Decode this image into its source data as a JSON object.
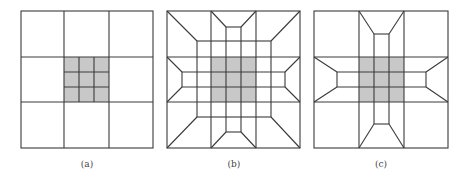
{
  "figure": {
    "colors": {
      "line": "#3a3a3a",
      "shade": "#c8c8c8",
      "background": "#ffffff"
    },
    "panels": [
      {
        "id": "a",
        "label": "(a)",
        "description": "3x3 grid with shaded center cell subdivided 3x3"
      },
      {
        "id": "b",
        "label": "(b)",
        "description": "Shaded center 3x3 block with transition elements extending to boundary in all directions including corners"
      },
      {
        "id": "c",
        "label": "(c)",
        "description": "Shaded center 3x3 block with cross-shaped transition arms to the four sides; corner cells unrefined"
      }
    ]
  }
}
